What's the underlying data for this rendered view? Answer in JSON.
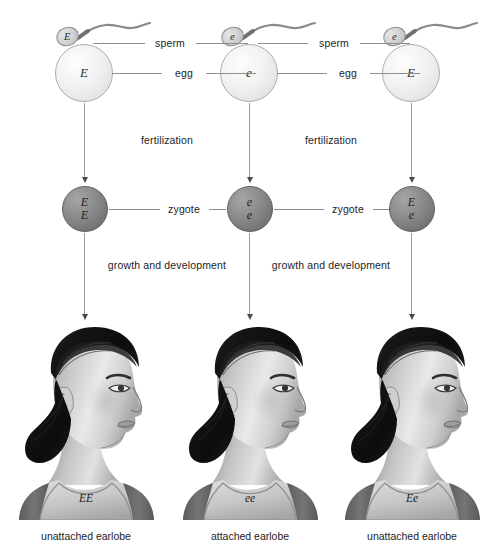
{
  "diagram": {
    "background_color": "#ffffff",
    "row_labels": {
      "sperm": "sperm",
      "egg": "egg",
      "fertilization": "fertilization",
      "zygote": "zygote",
      "growth": "growth and development"
    },
    "connector_labels": {
      "sperm_left": "sperm",
      "sperm_right": "sperm",
      "egg_left": "egg",
      "egg_right": "egg",
      "zygote_left": "zygote",
      "zygote_right": "zygote",
      "fertilization_left": "fertilization",
      "fertilization_right": "fertilization",
      "growth_left": "growth and development",
      "growth_right": "growth and development"
    },
    "colors": {
      "egg_fill": "#f2f2f2",
      "egg_stroke": "#adadad",
      "sperm_fill": "#d2d2d2",
      "zygote_fill": "#808080",
      "zygote_stroke": "#5e5e5e",
      "line": "#8e8e8e",
      "arrow": "#4a4a4a",
      "text": "#242424",
      "hair": "#171717",
      "skin_light": "#e8e8e8",
      "skin_mid": "#bdbdbd",
      "skin_dark": "#8a8a8a",
      "garment": "#6f6f6f"
    },
    "columns": [
      {
        "id": "column-1",
        "sperm_allele": "E",
        "egg_allele": "E",
        "zygote_alleles": [
          "E",
          "E"
        ],
        "genotype": "EE",
        "phenotype": "unattached earlobe"
      },
      {
        "id": "column-2",
        "sperm_allele": "e",
        "egg_allele": "e",
        "zygote_alleles": [
          "e",
          "e"
        ],
        "genotype": "ee",
        "phenotype": "attached earlobe"
      },
      {
        "id": "column-3",
        "sperm_allele": "e",
        "egg_allele": "E",
        "zygote_alleles": [
          "E",
          "e"
        ],
        "genotype": "Ee",
        "phenotype": "unattached earlobe"
      }
    ]
  }
}
